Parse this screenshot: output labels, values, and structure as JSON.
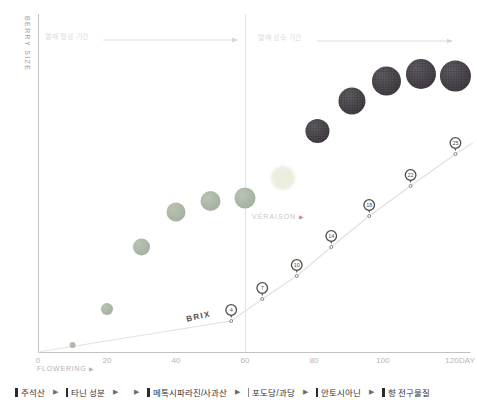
{
  "chart_data": {
    "type": "scatter",
    "ylabel": "BERRY SIZE",
    "xlabel": "DAY",
    "x_start_label": "FLOWERING",
    "x_ticks": [
      0,
      20,
      40,
      60,
      80,
      100,
      120
    ],
    "x_range": [
      0,
      126
    ],
    "grid": false,
    "phases": {
      "left": "열매 형성 기간",
      "right": "열매 성숙 기간"
    },
    "veraison": {
      "label": "VÉRAISON",
      "arrow": "▶",
      "day": 61
    },
    "brix": {
      "label": "BRIX",
      "points": [
        {
          "day": 56,
          "value": 4,
          "y": 321
        },
        {
          "day": 65,
          "value": 7,
          "y": 299
        },
        {
          "day": 75,
          "value": 10,
          "y": 276
        },
        {
          "day": 85,
          "value": 14,
          "y": 247
        },
        {
          "day": 96,
          "value": 18,
          "y": 216
        },
        {
          "day": 108,
          "value": 22,
          "y": 186
        },
        {
          "day": 121,
          "value": 25,
          "y": 154
        }
      ],
      "line": [
        {
          "day": 0,
          "y": 352
        },
        {
          "day": 56,
          "y": 321
        },
        {
          "day": 65,
          "y": 299
        },
        {
          "day": 75,
          "y": 276
        },
        {
          "day": 85,
          "y": 247
        },
        {
          "day": 96,
          "y": 216
        },
        {
          "day": 108,
          "y": 186
        },
        {
          "day": 121,
          "y": 154
        },
        {
          "day": 126,
          "y": 143
        }
      ]
    },
    "berries": {
      "green": [
        {
          "day": 10,
          "y": 345,
          "r": 3
        },
        {
          "day": 20,
          "y": 309,
          "r": 6
        },
        {
          "day": 30,
          "y": 247,
          "r": 8.5
        },
        {
          "day": 40,
          "y": 212,
          "r": 9.5
        },
        {
          "day": 50,
          "y": 201,
          "r": 10
        },
        {
          "day": 60,
          "y": 198,
          "r": 10.5
        }
      ],
      "transition": {
        "day": 71,
        "y": 178,
        "r": 12
      },
      "ripe": [
        {
          "day": 81,
          "y": 131,
          "r": 12
        },
        {
          "day": 91,
          "y": 101,
          "r": 13.5
        },
        {
          "day": 101,
          "y": 81,
          "r": 14.5
        },
        {
          "day": 111,
          "y": 74,
          "r": 15
        },
        {
          "day": 121,
          "y": 76,
          "r": 15.5
        }
      ]
    }
  },
  "legend": {
    "items": [
      {
        "bar": "thick",
        "label": "주석산",
        "arrows": 1
      },
      {
        "bar": "thick",
        "label": "타닌 성분",
        "arrows": 2
      },
      {
        "bar": "thick",
        "label": "메톡시파라진/사과산",
        "arrows": 1
      },
      {
        "bar": "thin",
        "label": "포도당/과당",
        "arrows": 1
      },
      {
        "bar": "thick",
        "label": "안토시아닌",
        "arrows": 1
      },
      {
        "bar": "thick",
        "label": "향 전구물질",
        "arrows": 0
      }
    ],
    "arrow_glyph": "▶"
  },
  "labels": {
    "flowering_arrow": "▶"
  },
  "colors": {
    "axis": "#c2c2c2",
    "phase_text": "#dcdcdc",
    "phase_arrow": "#d6d6d6",
    "veraison_line": "#e3e6e1",
    "brix_line": "#dfe3dc",
    "green_berry": "#a3b09f",
    "transition_berry": "#ebeedf",
    "ripe_berry": "#3f3a40",
    "pin": "#4f4f4f"
  }
}
